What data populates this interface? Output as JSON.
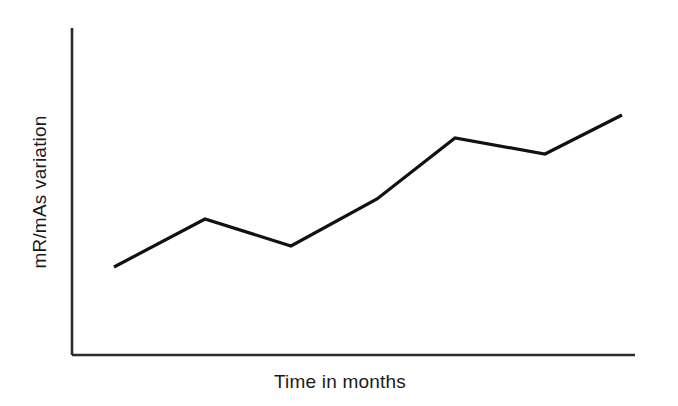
{
  "figure": {
    "background_color": "#ffffff",
    "line_color": "#111111",
    "axis_color": "#2b2b2b",
    "text_color": "#1a1a1a",
    "x_axis_label": "Time in months",
    "y_axis_label": "mR/mAs variation"
  },
  "chart_data": {
    "type": "line",
    "title": "",
    "subtitle": "",
    "xlabel": "Time in months",
    "ylabel": "mR/mAs variation",
    "grid": false,
    "legend": false,
    "legend_position": "none",
    "x_tick_labels": [],
    "y_tick_labels": [],
    "xlim": [
      0,
      10
    ],
    "ylim": [
      0,
      10
    ],
    "annotations": [],
    "series": [
      {
        "name": "mR/mAs variation",
        "color": "#111111",
        "x": [
          0.75,
          2.37,
          3.9,
          5.43,
          6.82,
          8.42,
          9.79
        ],
        "values": [
          2.69,
          4.16,
          3.33,
          4.77,
          6.64,
          6.15,
          7.34
        ],
        "pixel_points": [
          {
            "x": 114,
            "y": 267
          },
          {
            "x": 205,
            "y": 219
          },
          {
            "x": 291,
            "y": 246
          },
          {
            "x": 377,
            "y": 199
          },
          {
            "x": 455,
            "y": 138
          },
          {
            "x": 545,
            "y": 154
          },
          {
            "x": 622,
            "y": 115
          }
        ]
      }
    ],
    "axes_geometry": {
      "origin_x": 72,
      "origin_y": 355,
      "y_axis_top": 28,
      "x_axis_right": 635
    }
  }
}
